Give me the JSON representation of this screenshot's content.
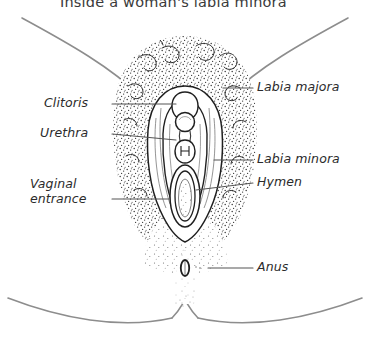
{
  "title": "Inside a woman's labia minora",
  "colors": {
    "ink": "#2b2b2b",
    "line_grey": "#8d8d8d",
    "stipple": "#3b3b3b",
    "background": "#ffffff",
    "leader": "#555555"
  },
  "labels": {
    "labia_majora": "Labia majora",
    "clitoris": "Clitoris",
    "urethra": "Urethra",
    "labia_minora": "Labia minora",
    "hymen": "Hymen",
    "vaginal_entrance_line1": "Vaginal",
    "vaginal_entrance_line2": "entrance",
    "anus": "Anus"
  },
  "diagram": {
    "type": "anatomical-illustration",
    "view": "frontal",
    "parts": [
      {
        "name": "labia-majora",
        "side": "right",
        "label": "Labia majora"
      },
      {
        "name": "clitoris",
        "side": "left",
        "label": "Clitoris"
      },
      {
        "name": "urethra",
        "side": "left",
        "label": "Urethra"
      },
      {
        "name": "labia-minora",
        "side": "right",
        "label": "Labia minora"
      },
      {
        "name": "hymen",
        "side": "right",
        "label": "Hymen"
      },
      {
        "name": "vaginal-entrance",
        "side": "left",
        "label": "Vaginal entrance"
      },
      {
        "name": "anus",
        "side": "right",
        "label": "Anus"
      }
    ]
  }
}
